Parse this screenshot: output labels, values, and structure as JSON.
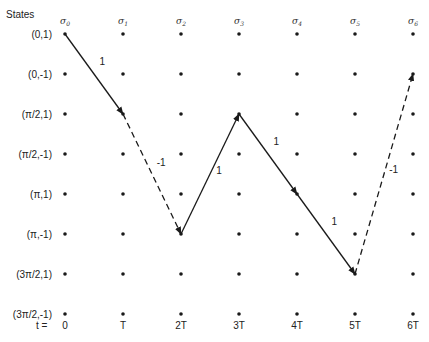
{
  "diagram": {
    "axis_title": "States",
    "time_prefix": "t =",
    "states": [
      "(0,1)",
      "(0,-1)",
      "(π/2,1)",
      "(π/2,-1)",
      "(π,1)",
      "(π,-1)",
      "(3π/2,1)",
      "(3π/2,-1)"
    ],
    "stages": [
      {
        "sigma": "σ",
        "sub": "0",
        "time": "0"
      },
      {
        "sigma": "σ",
        "sub": "1",
        "time": "T"
      },
      {
        "sigma": "σ",
        "sub": "2",
        "time": "2T"
      },
      {
        "sigma": "σ",
        "sub": "3",
        "time": "3T"
      },
      {
        "sigma": "σ",
        "sub": "4",
        "time": "4T"
      },
      {
        "sigma": "σ",
        "sub": "5",
        "time": "5T"
      },
      {
        "sigma": "σ",
        "sub": "6",
        "time": "6T"
      }
    ],
    "path": [
      {
        "from_stage": 0,
        "from_state": 0,
        "to_stage": 1,
        "to_state": 2,
        "label": "1",
        "style": "solid"
      },
      {
        "from_stage": 1,
        "from_state": 2,
        "to_stage": 2,
        "to_state": 5,
        "label": "-1",
        "style": "dashed"
      },
      {
        "from_stage": 2,
        "from_state": 5,
        "to_stage": 3,
        "to_state": 2,
        "label": "1",
        "style": "solid"
      },
      {
        "from_stage": 3,
        "from_state": 2,
        "to_stage": 4,
        "to_state": 4,
        "label": "1",
        "style": "solid"
      },
      {
        "from_stage": 4,
        "from_state": 4,
        "to_stage": 5,
        "to_state": 6,
        "label": "1",
        "style": "solid"
      },
      {
        "from_stage": 5,
        "from_state": 6,
        "to_stage": 6,
        "to_state": 1,
        "label": "-1",
        "style": "dashed"
      }
    ],
    "colors": {
      "ink": "#1a1a1a",
      "background": "#ffffff"
    }
  }
}
